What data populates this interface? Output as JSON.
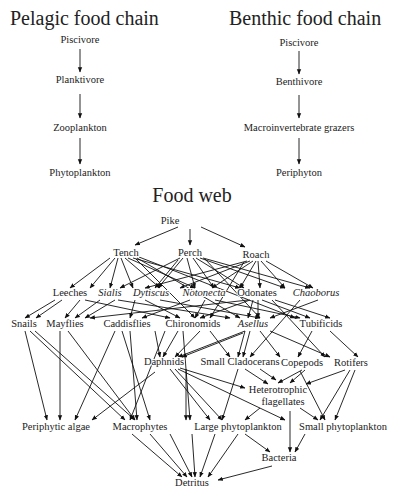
{
  "pelagic": {
    "title": "Pelagic food chain",
    "nodes": [
      "Piscivore",
      "Planktivore",
      "Zooplankton",
      "Phytoplankton"
    ]
  },
  "benthic": {
    "title": "Benthic food chain",
    "nodes": [
      "Piscivore",
      "Benthivore",
      "Macroinvertebrate grazers",
      "Periphyton"
    ]
  },
  "foodweb": {
    "title": "Food web",
    "nodes": [
      {
        "id": "pike",
        "label": "Pike",
        "x": 170,
        "y": 224
      },
      {
        "id": "tench",
        "label": "Tench",
        "x": 126,
        "y": 256
      },
      {
        "id": "perch",
        "label": "Perch",
        "x": 190,
        "y": 256
      },
      {
        "id": "roach",
        "label": "Roach",
        "x": 256,
        "y": 258
      },
      {
        "id": "leeches",
        "label": "Leeches",
        "x": 70,
        "y": 296
      },
      {
        "id": "sialis",
        "label": "Sialis",
        "x": 110,
        "y": 296,
        "italic": true
      },
      {
        "id": "dytiscus",
        "label": "Dytiscus",
        "x": 151,
        "y": 296,
        "italic": true
      },
      {
        "id": "notonecta",
        "label": "Notonecta",
        "x": 204,
        "y": 296,
        "italic": true
      },
      {
        "id": "odonates",
        "label": "Odonates",
        "x": 257,
        "y": 296
      },
      {
        "id": "chaoborus",
        "label": "Chaoborus",
        "x": 316,
        "y": 296,
        "italic": true
      },
      {
        "id": "snails",
        "label": "Snails",
        "x": 24,
        "y": 327
      },
      {
        "id": "mayflies",
        "label": "Mayflies",
        "x": 65,
        "y": 327
      },
      {
        "id": "caddisflies",
        "label": "Caddisflies",
        "x": 127,
        "y": 327
      },
      {
        "id": "chironomids",
        "label": "Chironomids",
        "x": 193,
        "y": 327
      },
      {
        "id": "asellus",
        "label": "Asellus",
        "x": 253,
        "y": 327,
        "italic": true
      },
      {
        "id": "tubificids",
        "label": "Tubificids",
        "x": 321,
        "y": 327
      },
      {
        "id": "daphnids",
        "label": "Daphnids",
        "x": 164,
        "y": 365
      },
      {
        "id": "smallclad",
        "label": "Small Cladocerans",
        "x": 240,
        "y": 365
      },
      {
        "id": "copepods",
        "label": "Copepods",
        "x": 302,
        "y": 366
      },
      {
        "id": "rotifers",
        "label": "Rotifers",
        "x": 351,
        "y": 366
      },
      {
        "id": "hetero1",
        "label": "Heterotrophic",
        "x": 278,
        "y": 393
      },
      {
        "id": "hetero2",
        "label": "flagellates",
        "x": 283,
        "y": 405
      },
      {
        "id": "periphytic",
        "label": "Periphytic algae",
        "x": 56,
        "y": 430
      },
      {
        "id": "macrophytes",
        "label": "Macrophytes",
        "x": 140,
        "y": 430
      },
      {
        "id": "largephyto",
        "label": "Large phytoplankton",
        "x": 238,
        "y": 430
      },
      {
        "id": "smallphyto",
        "label": "Small phytoplankton",
        "x": 343,
        "y": 430
      },
      {
        "id": "bacteria",
        "label": "Bacteria",
        "x": 279,
        "y": 461
      },
      {
        "id": "detritus",
        "label": "Detritus",
        "x": 192,
        "y": 486
      }
    ]
  }
}
